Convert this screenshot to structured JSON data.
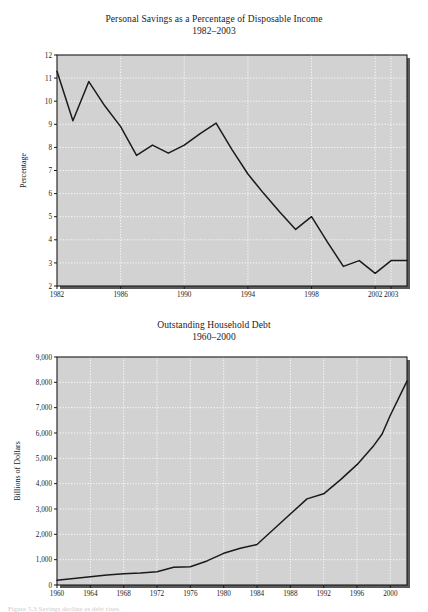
{
  "page": {
    "caption": "Figure 5.3  Savings decline as debt rises."
  },
  "figures": [
    {
      "id": "personal-savings",
      "title": "Personal Savings as a Percentage of Disposable Income",
      "subtitle": "1982–2003"
    },
    {
      "id": "household-debt",
      "title": "Outstanding Household Debt",
      "subtitle": "1960–2000"
    }
  ],
  "chart_data": [
    {
      "type": "line",
      "title": "Personal Savings as a Percentage of Disposable Income",
      "subtitle": "1982–2003",
      "xlabel": "",
      "ylabel": "Percentage",
      "xlim": [
        1982,
        2004
      ],
      "ylim": [
        2,
        12
      ],
      "grid": true,
      "legend": "none",
      "plot_background": "#d2d2d2",
      "gridline_color": "#ffffff",
      "line_color": "#1a1a1a",
      "xticks": [
        1982,
        1986,
        1990,
        1994,
        1998,
        2002,
        2003
      ],
      "xtick_labels": [
        "1982",
        "1986",
        "1990",
        "1994",
        "1998",
        "2002",
        "2003"
      ],
      "yticks": [
        2,
        3,
        4,
        5,
        6,
        7,
        8,
        9,
        10,
        11,
        12
      ],
      "ytick_labels": [
        "2",
        "3",
        "4",
        "5",
        "6",
        "7",
        "8",
        "9",
        "10",
        "11",
        "12"
      ],
      "x": [
        1982,
        1983,
        1984,
        1985,
        1986,
        1987,
        1988,
        1989,
        1990,
        1991,
        1992,
        1993,
        1994,
        1995,
        1996,
        1997,
        1998,
        1999,
        2000,
        2001,
        2002,
        2003,
        2004
      ],
      "values": [
        11.3,
        9.15,
        10.85,
        9.8,
        8.9,
        7.65,
        8.1,
        7.75,
        8.1,
        8.6,
        9.05,
        7.9,
        6.85,
        6.0,
        5.2,
        4.45,
        5.0,
        3.9,
        2.85,
        3.1,
        2.55,
        3.1,
        3.1
      ],
      "series": [
        {
          "name": "Personal savings rate",
          "values": [
            11.3,
            9.15,
            10.85,
            9.8,
            8.9,
            7.65,
            8.1,
            7.75,
            8.1,
            8.6,
            9.05,
            7.9,
            6.85,
            6.0,
            5.2,
            4.45,
            5.0,
            3.9,
            2.85,
            3.1,
            2.55,
            3.1,
            3.1
          ]
        }
      ]
    },
    {
      "type": "line",
      "title": "Outstanding Household Debt",
      "subtitle": "1960–2000",
      "xlabel": "",
      "ylabel": "Billions of Dollars",
      "xlim": [
        1960,
        2002
      ],
      "ylim": [
        0,
        9000
      ],
      "grid": true,
      "legend": "none",
      "plot_background": "#d2d2d2",
      "gridline_color": "#ffffff",
      "line_color": "#1a1a1a",
      "xticks": [
        1960,
        1964,
        1968,
        1972,
        1976,
        1980,
        1984,
        1988,
        1992,
        1996,
        2000
      ],
      "xtick_labels": [
        "1960",
        "1964",
        "1968",
        "1972",
        "1976",
        "1980",
        "1984",
        "1988",
        "1992",
        "1996",
        "2000"
      ],
      "yticks": [
        0,
        1000,
        2000,
        3000,
        4000,
        5000,
        6000,
        7000,
        8000,
        9000
      ],
      "ytick_labels": [
        "0",
        "1,000",
        "2,000",
        "3,000",
        "4,000",
        "5,000",
        "6,000",
        "7,000",
        "8,000",
        "9,000"
      ],
      "x": [
        1960,
        1962,
        1964,
        1966,
        1968,
        1970,
        1972,
        1974,
        1976,
        1978,
        1980,
        1982,
        1984,
        1986,
        1988,
        1990,
        1992,
        1994,
        1996,
        1998,
        1999,
        2000,
        2002
      ],
      "values": [
        190,
        260,
        330,
        390,
        440,
        470,
        520,
        700,
        720,
        950,
        1250,
        1450,
        1600,
        2200,
        2800,
        3400,
        3600,
        4150,
        4750,
        5500,
        5950,
        6700,
        8050
      ],
      "series": [
        {
          "name": "Outstanding household debt",
          "values": [
            190,
            260,
            330,
            390,
            440,
            470,
            520,
            700,
            720,
            950,
            1250,
            1450,
            1600,
            2200,
            2800,
            3400,
            3600,
            4150,
            4750,
            5500,
            5950,
            6700,
            8050
          ]
        }
      ]
    }
  ]
}
